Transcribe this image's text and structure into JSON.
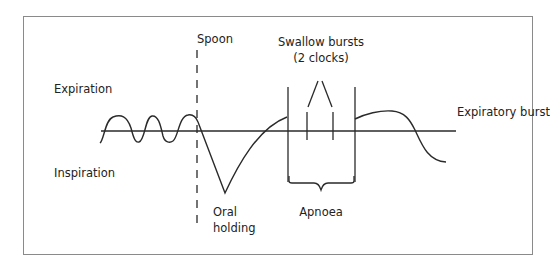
{
  "diagram": {
    "title": "",
    "labels": {
      "expiration": "Expiration",
      "inspiration": "Inspiration",
      "spoon": "Spoon",
      "swallow_bursts_line1": "Swallow bursts",
      "swallow_bursts_line2": "(2 clocks)",
      "expiratory_burst": "Expiratory burst",
      "oral_holding_line1": "Oral",
      "oral_holding_line2": "holding",
      "apnoea": "Apnoea"
    },
    "colors": {
      "stroke": "#2a2a2a",
      "frame": "#8a8a8a",
      "background": "#ffffff"
    }
  }
}
